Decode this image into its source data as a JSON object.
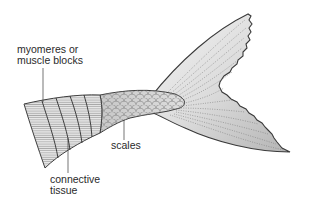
{
  "diagram": {
    "labels": {
      "myomeres_line1": "myomeres or",
      "myomeres_line2": "muscle blocks",
      "scales": "scales",
      "connective_line1": "connective",
      "connective_line2": "tissue"
    },
    "parts": [
      "myomeres-or-muscle-blocks",
      "connective-tissue",
      "scales",
      "caudal-fin"
    ],
    "colors": {
      "outline": "#3a3a3a",
      "fin_fill_light": "#f2f2f2",
      "fin_fill_dark": "#b8b8b8",
      "muscle_fill": "#e6e6e6",
      "scales_fill": "#d4d4d4",
      "label_text": "#2a2a2a"
    }
  }
}
